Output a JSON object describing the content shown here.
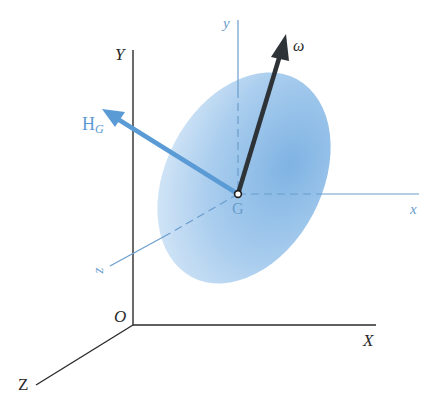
{
  "diagram": {
    "type": "3d-rigid-body-angular-momentum",
    "colors": {
      "inertial_axes": "#2b2b2b",
      "body_axes": "#6a9dcc",
      "body_fill_light": "#d6e8f7",
      "body_fill_dark": "#7fb3e3",
      "HG_vector": "#5b9bd5",
      "omega_vector": "#2e3338"
    },
    "inertial_frame": {
      "origin_label": "O",
      "x_label": "X",
      "y_label": "Y",
      "z_label": "Z"
    },
    "body_frame": {
      "origin_label": "G",
      "x_label": "x",
      "y_label": "y",
      "z_label": "z"
    },
    "vectors": {
      "angular_momentum": {
        "label_main": "H",
        "label_sub": "G"
      },
      "angular_velocity": {
        "label": "ω"
      }
    }
  }
}
